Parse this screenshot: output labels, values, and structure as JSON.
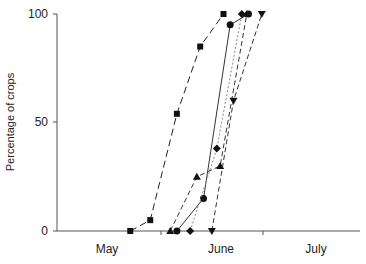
{
  "chart_data": {
    "type": "line",
    "title": "",
    "xlabel": "",
    "ylabel": "Percentage of crops",
    "ylim": [
      0,
      100
    ],
    "yticks": [
      0,
      50,
      100
    ],
    "xticks_labels": [
      "May",
      "June",
      "July"
    ],
    "x_unit": "day of season (May 1 = 0)",
    "xlim": [
      0,
      92
    ],
    "grid": false,
    "legend": "none",
    "series": [
      {
        "name": "square",
        "marker": "square",
        "line": "long-dash",
        "color": "#222222",
        "x": [
          22,
          28,
          36,
          43,
          50
        ],
        "y": [
          0,
          5,
          54,
          85,
          100
        ]
      },
      {
        "name": "triangle-up",
        "marker": "triangle-up",
        "line": "dash",
        "color": "#333333",
        "x": [
          34,
          42,
          49,
          57
        ],
        "y": [
          0,
          25,
          30,
          100
        ]
      },
      {
        "name": "circle",
        "marker": "circle",
        "line": "solid",
        "color": "#333333",
        "x": [
          36,
          44,
          52,
          57.5
        ],
        "y": [
          0,
          15,
          95,
          100
        ]
      },
      {
        "name": "diamond",
        "marker": "diamond",
        "line": "dotted",
        "color": "#888888",
        "x": [
          40,
          48,
          55.5
        ],
        "y": [
          0,
          38,
          100
        ]
      },
      {
        "name": "triangle-down",
        "marker": "triangle-down",
        "line": "dash",
        "color": "#333333",
        "x": [
          46.5,
          53,
          61.5
        ],
        "y": [
          0,
          60,
          100
        ]
      }
    ]
  }
}
